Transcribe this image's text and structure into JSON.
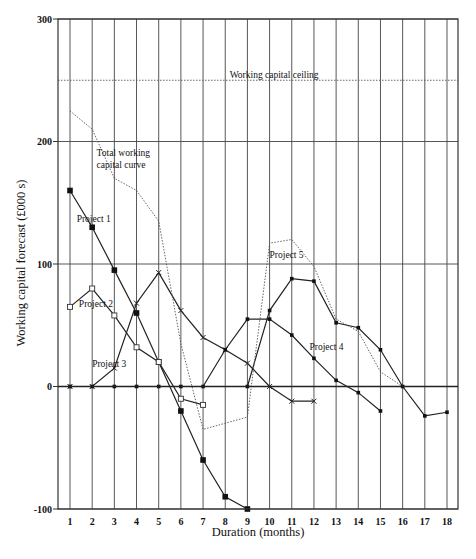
{
  "chart_data": {
    "type": "line",
    "title": "",
    "xlabel": "Duration (months)",
    "ylabel": "Working capital forecast (£000 s)",
    "x": [
      1,
      2,
      3,
      4,
      5,
      6,
      7,
      8,
      9,
      10,
      11,
      12,
      13,
      14,
      15,
      16,
      17,
      18
    ],
    "xlim": [
      0.5,
      18.5
    ],
    "ylim": [
      -100,
      300
    ],
    "yticks": [
      -100,
      0,
      100,
      200,
      300
    ],
    "grid": true,
    "legend": "inline annotations",
    "series": [
      {
        "name": "Project 1",
        "marker": "filled-square",
        "style": "solid",
        "x": [
          1,
          2,
          3,
          4,
          5,
          6,
          7,
          8,
          9
        ],
        "values": [
          160,
          130,
          95,
          60,
          20,
          -20,
          -60,
          -90,
          -100
        ]
      },
      {
        "name": "Project 2",
        "marker": "open-square",
        "style": "solid",
        "x": [
          1,
          2,
          3,
          4,
          5,
          6,
          7
        ],
        "values": [
          65,
          80,
          58,
          32,
          20,
          -10,
          -15
        ]
      },
      {
        "name": "Project 3",
        "marker": "cross",
        "style": "solid",
        "x": [
          1,
          2,
          3,
          4,
          5,
          6,
          7,
          8,
          9,
          10,
          11,
          12
        ],
        "values": [
          0,
          0,
          15,
          68,
          93,
          62,
          40,
          30,
          19,
          0,
          -12,
          -12
        ]
      },
      {
        "name": "Project 4",
        "marker": "dot",
        "style": "solid",
        "x": [
          1,
          2,
          3,
          4,
          5,
          6,
          7,
          8,
          9,
          10,
          11,
          12,
          13,
          14,
          15
        ],
        "values": [
          0,
          0,
          0,
          0,
          0,
          0,
          0,
          30,
          55,
          55,
          42,
          23,
          5,
          -5,
          -20
        ]
      },
      {
        "name": "Project 5",
        "marker": "dot",
        "style": "solid",
        "x": [
          9,
          10,
          11,
          12,
          13,
          14,
          15,
          16,
          17,
          18
        ],
        "values": [
          0,
          62,
          88,
          86,
          52,
          48,
          30,
          0,
          -24,
          -21
        ]
      },
      {
        "name": "Total working capital curve",
        "marker": "none",
        "style": "dotted",
        "x": [
          1,
          2,
          3,
          4,
          5,
          6,
          7,
          8,
          9,
          10,
          11,
          12,
          13,
          14,
          15,
          16
        ],
        "values": [
          225,
          210,
          170,
          160,
          135,
          35,
          -35,
          -30,
          -25,
          117,
          120,
          98,
          55,
          45,
          12,
          0
        ]
      },
      {
        "name": "Working capital ceiling",
        "marker": "none",
        "style": "dotted",
        "x": [
          0.5,
          18.5
        ],
        "values": [
          250,
          250
        ]
      }
    ],
    "annotations": [
      {
        "text": "Working capital ceiling",
        "x": 8.2,
        "y": 252
      },
      {
        "text": "Total working",
        "x": 2.2,
        "y": 188
      },
      {
        "text": "capital curve",
        "x": 2.2,
        "y": 178
      },
      {
        "text": "Project 1",
        "x": 1.3,
        "y": 134
      },
      {
        "text": "Project 2",
        "x": 1.4,
        "y": 65
      },
      {
        "text": "Project 3",
        "x": 2.0,
        "y": 16
      },
      {
        "text": "Project 4",
        "x": 11.8,
        "y": 30
      },
      {
        "text": "Project 5",
        "x": 10.0,
        "y": 105
      }
    ]
  }
}
